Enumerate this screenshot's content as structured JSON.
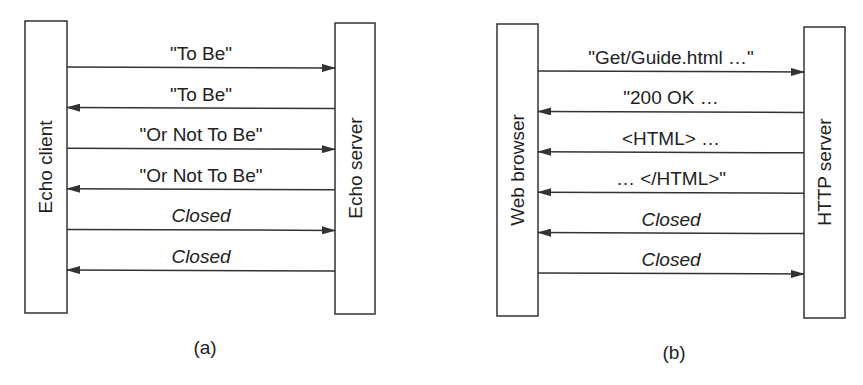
{
  "panels": [
    {
      "caption": "(a)",
      "left_entity": "Echo client",
      "right_entity": "Echo server",
      "messages": [
        {
          "label": "\"To Be\"",
          "direction": "right",
          "italic": false
        },
        {
          "label": "\"To Be\"",
          "direction": "left",
          "italic": false
        },
        {
          "label": "\"Or Not To Be\"",
          "direction": "right",
          "italic": false
        },
        {
          "label": "\"Or Not To Be\"",
          "direction": "left",
          "italic": false
        },
        {
          "label": "Closed",
          "direction": "right",
          "italic": true
        },
        {
          "label": "Closed",
          "direction": "left",
          "italic": true
        }
      ]
    },
    {
      "caption": "(b)",
      "left_entity": "Web browser",
      "right_entity": "HTTP server",
      "messages": [
        {
          "label": "\"Get/Guide.html …\"",
          "direction": "right",
          "italic": false
        },
        {
          "label": "\"200 OK …",
          "direction": "left",
          "italic": false
        },
        {
          "label": "<HTML> …",
          "direction": "left",
          "italic": false
        },
        {
          "label": "… </HTML>\"",
          "direction": "left",
          "italic": false
        },
        {
          "label": "Closed",
          "direction": "left",
          "italic": true
        },
        {
          "label": "Closed",
          "direction": "right",
          "italic": true
        }
      ]
    }
  ]
}
